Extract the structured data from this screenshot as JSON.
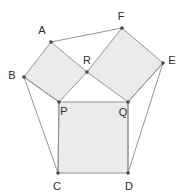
{
  "diagram": {
    "type": "geometric-construction",
    "canvas": {
      "width": 185,
      "height": 196
    },
    "colors": {
      "fill": "#ebebeb",
      "stroke": "#8a8a8a",
      "vertex": "#4a4a4a",
      "label": "#2b2b2b",
      "background": "#ffffff"
    },
    "points": {
      "A": {
        "label": "A",
        "x": 51,
        "y": 42,
        "label_x": 42,
        "label_y": 31
      },
      "B": {
        "label": "B",
        "x": 24,
        "y": 77,
        "label_x": 12,
        "label_y": 76
      },
      "C": {
        "label": "C",
        "x": 58,
        "y": 173,
        "label_x": 57,
        "label_y": 187
      },
      "D": {
        "label": "D",
        "x": 128,
        "y": 173,
        "label_x": 129,
        "label_y": 187
      },
      "E": {
        "label": "E",
        "x": 163,
        "y": 63,
        "label_x": 172,
        "label_y": 61
      },
      "F": {
        "label": "F",
        "x": 122,
        "y": 28,
        "label_x": 121,
        "label_y": 17
      },
      "P": {
        "label": "P",
        "x": 59,
        "y": 102,
        "label_x": 64,
        "label_y": 112
      },
      "Q": {
        "label": "Q",
        "x": 128,
        "y": 102,
        "label_x": 123,
        "label_y": 113
      },
      "R": {
        "label": "R",
        "x": 87,
        "y": 72,
        "label_x": 87,
        "label_y": 61
      }
    },
    "shapes": [
      {
        "name": "square-left-ABPR",
        "vertices": "A,B,P,R",
        "points": "51,42 24,77 59,102 87,72"
      },
      {
        "name": "square-right-RFEQ",
        "vertices": "R,F,E,Q",
        "points": "87,72 122,28 163,63 128,102"
      },
      {
        "name": "square-center-PQDC",
        "vertices": "P,Q,D,C",
        "points": "59,102 128,102 128,173 58,173"
      }
    ],
    "segments": [
      {
        "name": "segment-A-F",
        "from": "A",
        "to": "F",
        "x1": 51,
        "y1": 42,
        "x2": 122,
        "y2": 28
      },
      {
        "name": "segment-B-C",
        "from": "B",
        "to": "C",
        "x1": 24,
        "y1": 77,
        "x2": 58,
        "y2": 173
      },
      {
        "name": "segment-B-P",
        "from": "B",
        "to": "P",
        "x1": 24,
        "y1": 77,
        "x2": 59,
        "y2": 102
      },
      {
        "name": "segment-P-C",
        "from": "P",
        "to": "C",
        "x1": 59,
        "y1": 102,
        "x2": 58,
        "y2": 173
      },
      {
        "name": "segment-E-D",
        "from": "E",
        "to": "D",
        "x1": 163,
        "y1": 63,
        "x2": 128,
        "y2": 173
      },
      {
        "name": "segment-E-Q",
        "from": "E",
        "to": "Q",
        "x1": 163,
        "y1": 63,
        "x2": 128,
        "y2": 102
      },
      {
        "name": "segment-Q-D",
        "from": "Q",
        "to": "D",
        "x1": 128,
        "y1": 102,
        "x2": 128,
        "y2": 173
      }
    ],
    "vertex_order": [
      "A",
      "B",
      "C",
      "D",
      "E",
      "F",
      "P",
      "Q",
      "R"
    ]
  }
}
